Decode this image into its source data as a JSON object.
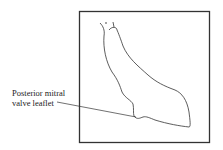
{
  "diagram": {
    "label_line1": "Posterior mitral",
    "label_line2": "valve leaflet",
    "stroke_color": "#222222",
    "background": "#ffffff"
  }
}
